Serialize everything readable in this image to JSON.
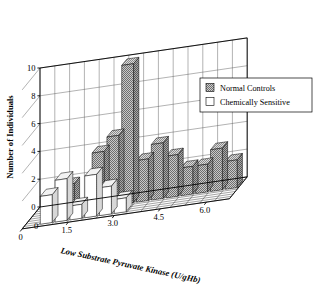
{
  "chart_data": {
    "type": "bar",
    "title": "",
    "subtitle": "",
    "xlabel": "Low Substrate Pyruvate Kinase (U/gHb)",
    "ylabel": "Number of Individuals",
    "zlabel": "",
    "projection": "3d",
    "grid": true,
    "ylim": [
      0,
      10
    ],
    "ytick_labels": [
      "0",
      "2",
      "4",
      "6",
      "8",
      "10"
    ],
    "ytick_values": [
      0,
      2,
      4,
      6,
      8,
      10
    ],
    "xtick_labels": [
      "0",
      "1.5",
      "3.0",
      "4.5",
      "6.0"
    ],
    "xtick_values": [
      0,
      1.5,
      3.0,
      4.5,
      6.0
    ],
    "x_origin_label": "0",
    "xlim": [
      0.0,
      6.75
    ],
    "bin_width": 0.45,
    "bin_centers": [
      0.45,
      0.9,
      1.35,
      1.8,
      2.25,
      2.7,
      3.15,
      3.6,
      4.05,
      4.5,
      4.95,
      5.4,
      5.85,
      6.3
    ],
    "legend_position": "upper right",
    "series": [
      {
        "name": "Normal Controls",
        "row": "back",
        "fill": "#9a9a9a",
        "pattern": "checker",
        "values": [
          0,
          0,
          2,
          0,
          4,
          5,
          10,
          3,
          4,
          3,
          2,
          2,
          3,
          2
        ]
      },
      {
        "name": "Chemically Sensitive",
        "row": "front",
        "fill": "#ffffff",
        "pattern": "solid",
        "values": [
          0,
          2,
          3,
          1,
          3,
          2,
          1,
          0,
          0,
          0,
          0,
          0,
          0,
          0
        ]
      }
    ]
  },
  "legend": {
    "entries": [
      {
        "label": "Normal Controls",
        "swatch": "checker-swatch"
      },
      {
        "label": "Chemically Sensitive",
        "swatch": "white-swatch"
      }
    ]
  },
  "axes": {
    "y_title": "Number of Individuals",
    "x_title": "Low Substrate Pyruvate Kinase (U/gHb)",
    "y_ticks": [
      "10",
      "8",
      "6",
      "4",
      "2",
      "0"
    ],
    "x_ticks": [
      "0",
      "1.5",
      "3.0",
      "4.5",
      "6.0"
    ]
  },
  "colors": {
    "bar_normal": "#9a9a9a",
    "bar_sensitive": "#ffffff",
    "axis": "#000000",
    "grid": "#555555",
    "background": "#ffffff"
  }
}
